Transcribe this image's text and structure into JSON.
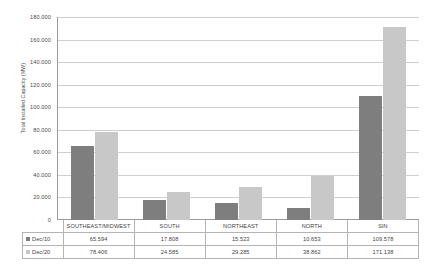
{
  "chart_data": {
    "type": "bar",
    "title": "",
    "xlabel": "",
    "ylabel": "Total Installed Capacity (MW)",
    "ylim": [
      0,
      180000
    ],
    "grid": true,
    "legend_position": "table-left",
    "categories": [
      "SOUTHEAST/MIDWEST",
      "SOUTH",
      "NORTHEAST",
      "NORTH",
      "SIN"
    ],
    "ytick_labels": [
      "180.000",
      "160.000",
      "140.000",
      "120.000",
      "100.000",
      "80.000",
      "60.000",
      "40.000",
      "20.000",
      "0"
    ],
    "ytick_values": [
      180000,
      160000,
      140000,
      120000,
      100000,
      80000,
      60000,
      40000,
      20000,
      0
    ],
    "series": [
      {
        "name": "Dec/10",
        "color": "#7e7e7e",
        "values": [
          65594,
          17808,
          15523,
          10653,
          109578
        ],
        "labels": [
          "65.594",
          "17.808",
          "15.523",
          "10.653",
          "109.578"
        ]
      },
      {
        "name": "Dec/20",
        "color": "#c8c8c8",
        "values": [
          78406,
          24585,
          29285,
          38862,
          171138
        ],
        "labels": [
          "78.406",
          "24.585",
          "29.285",
          "38.862",
          "171.138"
        ]
      }
    ]
  },
  "axis": {
    "y_title": "Total Installed Capacity (MW)"
  },
  "colors": {
    "series_0": "#7e7e7e",
    "series_1": "#c8c8c8",
    "gridline": "#cfcfcf",
    "axis": "#9a9a9a",
    "table_border": "#b4b4b4"
  }
}
